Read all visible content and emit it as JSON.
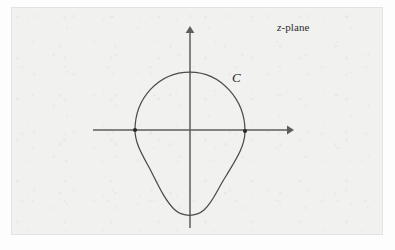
{
  "figure": {
    "title_label": "z-plane",
    "title_italic_part": "z",
    "title_rest_part": "-plane",
    "contour_label": "C",
    "background_color": "#f1f1f0",
    "page_color": "#fdfdfd",
    "axis_color": "#5d5d5d",
    "curve_color": "#4a4a4a",
    "marker_color": "#2b2b2b",
    "frame": {
      "x": 11,
      "y": 7,
      "width": 372,
      "height": 228
    },
    "axes": {
      "origin": {
        "x": 190,
        "y": 130
      },
      "horizontal": {
        "x_start": 93,
        "x_end": 291,
        "y": 130,
        "arrow": "right"
      },
      "vertical": {
        "y_start": 29,
        "y_end": 228,
        "x": 190,
        "arrow": "up"
      },
      "horizontal_icon": "right-arrow-icon",
      "vertical_icon": "up-arrow-icon"
    },
    "contour": {
      "name": "C",
      "closed": true,
      "left_corner": {
        "x": 135,
        "y": 130
      },
      "right_corner": {
        "x": 245,
        "y": 131
      },
      "top_point": {
        "x": 190,
        "y": 72
      },
      "bottom_point": {
        "x": 190,
        "y": 216
      },
      "upper_arc_description": "semicircular arc above the real axis from left corner to right corner",
      "lower_arc_description": "U-shaped arc below the real axis with inflection points on both flanks",
      "path_d": "M 135,130 C 135,99 158,72 190,72 C 221,72 245,99 245,131 C 245,146 236,160 227,174 C 218,189 214,201 205,210 C 197,217 183,217 175,210 C 165,201 158,186 150,170 C 143,155 135,144 135,130 Z"
    },
    "labels": {
      "plane_label_position": {
        "x": 277,
        "y": 22
      },
      "contour_label_position": {
        "x": 232,
        "y": 70
      }
    }
  }
}
